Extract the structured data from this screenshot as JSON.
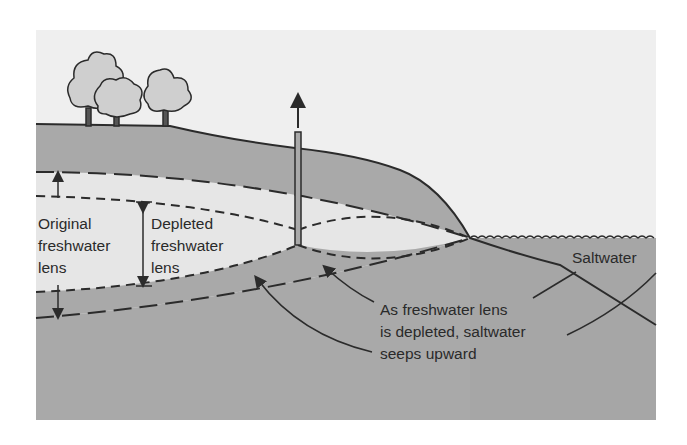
{
  "diagram": {
    "labels": {
      "original_lens": [
        "Original",
        "freshwater",
        "lens"
      ],
      "depleted_lens": [
        "Depleted",
        "freshwater",
        "lens"
      ],
      "saltwater": "Saltwater",
      "caption": [
        "As freshwater lens",
        "is depleted, saltwater",
        "seeps upward"
      ]
    },
    "colors": {
      "sky": "#efefef",
      "ground": "#a9a9a9",
      "freshwater": "#e6e6e6",
      "sea": "#a6a6a6",
      "line": "#2b2b2b"
    }
  }
}
